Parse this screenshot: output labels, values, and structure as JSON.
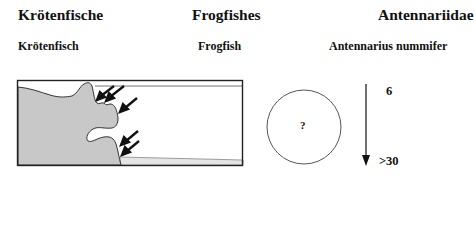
{
  "header": {
    "german_family": "Krötenfische",
    "english_family": "Frogfishes",
    "scientific_family": "Antennariidae"
  },
  "subheader": {
    "german_species": "Krötenfisch",
    "english_species": "Frogfish",
    "scientific_species": "Antennarius nummifer"
  },
  "habitat_diagram": {
    "description": "Reef profile with arrows pointing to crevices and overhangs",
    "arrow_count": 5
  },
  "size_indicator": {
    "symbol": "?"
  },
  "depth_range": {
    "min": "6",
    "max": ">30"
  },
  "colors": {
    "reef_fill": "#c8c8c8",
    "outline": "#222222",
    "sand": "#e4e4e4"
  }
}
